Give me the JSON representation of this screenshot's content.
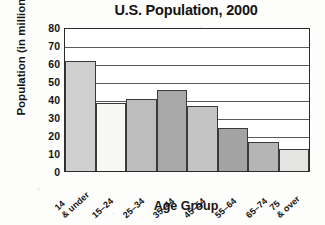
{
  "chart_data": {
    "type": "bar",
    "title": "U.S. Population, 2000",
    "xlabel": "Age Group",
    "ylabel": "Population (in millions)",
    "categories": [
      "14 & under",
      "15–24",
      "25–34",
      "35–44",
      "45–54",
      "55–64",
      "65–74",
      "75 & over"
    ],
    "category_lines": [
      [
        "14",
        "& under"
      ],
      [
        "15–24",
        ""
      ],
      [
        "25–34",
        ""
      ],
      [
        "35–44",
        ""
      ],
      [
        "45–54",
        ""
      ],
      [
        "55–64",
        ""
      ],
      [
        "65–74",
        ""
      ],
      [
        "75",
        "& over"
      ]
    ],
    "values": [
      61,
      38,
      40,
      45,
      36,
      24,
      16,
      12
    ],
    "bar_colors": [
      "#cfcfcf",
      "#f7f7f5",
      "#bdbdbd",
      "#a8a8a8",
      "#c4c4c4",
      "#a3a3a3",
      "#b5b5b5",
      "#e4e4e2"
    ],
    "ylim": [
      0,
      80
    ],
    "yticks": [
      0,
      10,
      20,
      30,
      40,
      50,
      60,
      70,
      80
    ],
    "ytick_labels": [
      "0",
      "10",
      "20",
      "30",
      "40",
      "50",
      "60",
      "70",
      "80"
    ],
    "grid": true,
    "legend": "none"
  }
}
